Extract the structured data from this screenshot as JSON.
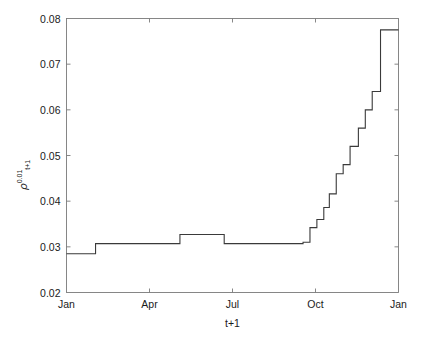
{
  "chart_data": {
    "type": "line",
    "title": "",
    "subtitle": "",
    "xlabel": "t+1",
    "ylabel_symbol": "ρ",
    "ylabel_superscript": "0.01",
    "ylabel_subscript": "t+1",
    "ylabel_plain": "ρ^0.01_t+1",
    "drawstyle": "steps-post",
    "grid": false,
    "legend": null,
    "line_color": "#3a3a3a",
    "axis_color": "#7a7a7a",
    "xlim": [
      0,
      12
    ],
    "ylim": [
      0.02,
      0.08
    ],
    "xticks": [
      0,
      3,
      6,
      9,
      12
    ],
    "xtick_labels": [
      "Jan",
      "Apr",
      "Jul",
      "Oct",
      "Jan"
    ],
    "yticks": [
      0.02,
      0.03,
      0.04,
      0.05,
      0.06,
      0.07,
      0.08
    ],
    "ytick_labels": [
      "0.02",
      "0.03",
      "0.04",
      "0.05",
      "0.06",
      "0.07",
      "0.08"
    ],
    "x": [
      0,
      1.05,
      1.05,
      3.45,
      3.45,
      4.1,
      4.1,
      5.7,
      5.7,
      8.55,
      8.55,
      8.8,
      8.8,
      9.05,
      9.05,
      9.3,
      9.3,
      9.5,
      9.5,
      9.75,
      9.75,
      10.0,
      10.0,
      10.25,
      10.25,
      10.55,
      10.55,
      10.8,
      10.8,
      11.05,
      11.05,
      11.35,
      11.35,
      12
    ],
    "y": [
      0.0285,
      0.0285,
      0.0307,
      0.0307,
      0.0307,
      0.0307,
      0.0327,
      0.0327,
      0.0307,
      0.0307,
      0.031,
      0.031,
      0.0342,
      0.0342,
      0.036,
      0.036,
      0.0386,
      0.0386,
      0.0416,
      0.0416,
      0.046,
      0.046,
      0.048,
      0.048,
      0.052,
      0.052,
      0.056,
      0.056,
      0.06,
      0.06,
      0.064,
      0.064,
      0.0775,
      0.0775
    ],
    "segments": [
      {
        "x_start": 0.0,
        "x_end": 1.05,
        "value": 0.0285
      },
      {
        "x_start": 1.05,
        "x_end": 3.45,
        "value": 0.0307
      },
      {
        "x_start": 3.45,
        "x_end": 4.1,
        "value": 0.0307
      },
      {
        "x_start": 4.1,
        "x_end": 5.7,
        "value": 0.0327
      },
      {
        "x_start": 5.7,
        "x_end": 8.55,
        "value": 0.0307
      },
      {
        "x_start": 8.55,
        "x_end": 8.8,
        "value": 0.031
      },
      {
        "x_start": 8.8,
        "x_end": 9.05,
        "value": 0.0342
      },
      {
        "x_start": 9.05,
        "x_end": 9.3,
        "value": 0.036
      },
      {
        "x_start": 9.3,
        "x_end": 9.5,
        "value": 0.0386
      },
      {
        "x_start": 9.5,
        "x_end": 9.75,
        "value": 0.0416
      },
      {
        "x_start": 9.75,
        "x_end": 10.0,
        "value": 0.046
      },
      {
        "x_start": 10.0,
        "x_end": 10.25,
        "value": 0.048
      },
      {
        "x_start": 10.25,
        "x_end": 10.55,
        "value": 0.052
      },
      {
        "x_start": 10.55,
        "x_end": 10.8,
        "value": 0.056
      },
      {
        "x_start": 10.8,
        "x_end": 11.05,
        "value": 0.06
      },
      {
        "x_start": 11.05,
        "x_end": 11.35,
        "value": 0.064
      },
      {
        "x_start": 11.35,
        "x_end": 12.0,
        "value": 0.0775
      }
    ]
  }
}
